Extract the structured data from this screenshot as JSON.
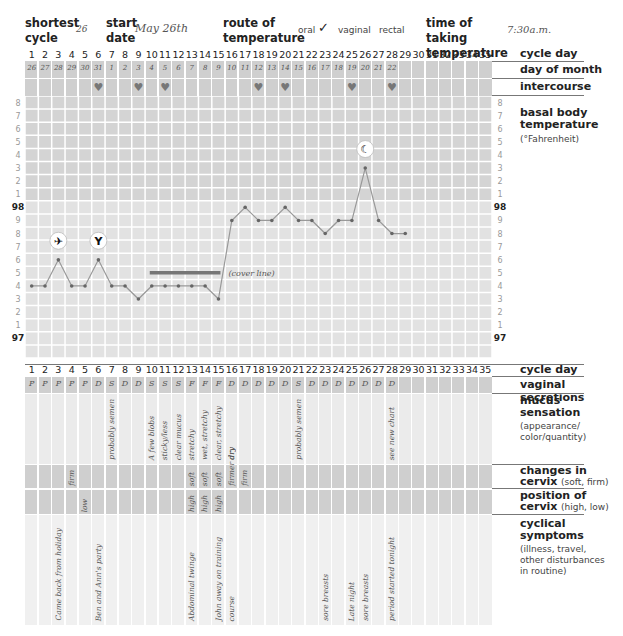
{
  "header": {
    "shortest_cycle_label": "shortest cycle",
    "shortest_cycle_value": "26",
    "start_date_label": "start date",
    "start_date_value": "May 26th",
    "route_label": "route of temperature",
    "route_options": [
      "oral",
      "vaginal",
      "rectal"
    ],
    "route_checked": "✓",
    "time_label": "time of taking temperature",
    "time_value": "7:30a.m."
  },
  "labels": {
    "cycle_day": "cycle day",
    "day_of_month": "day of month",
    "intercourse": "intercourse",
    "bbt_title": "basal body temperature",
    "bbt_unit": "(°Fahrenheit)",
    "vaginal_secretions": "vaginal secretions",
    "mucus_title": "mucus sensation",
    "mucus_sub": "(appearance/ color/quantity)",
    "changes_title": "changes in cervix",
    "changes_sub": "(soft, firm)",
    "position_title": "position of cervix",
    "position_sub": "(high, low)",
    "cyclical_title": "cyclical symptoms",
    "cyclical_sub": "(illness, travel, other disturbances in routine)",
    "cover_line": "(cover line)"
  },
  "cycle_days": [
    "1",
    "2",
    "3",
    "4",
    "5",
    "6",
    "7",
    "8",
    "9",
    "10",
    "11",
    "12",
    "13",
    "14",
    "15",
    "16",
    "17",
    "18",
    "19",
    "20",
    "21",
    "22",
    "23",
    "24",
    "25",
    "26",
    "27",
    "28",
    "29",
    "30",
    "31",
    "32",
    "33",
    "34",
    "35"
  ],
  "day_of_month": [
    "26",
    "27",
    "28",
    "29",
    "30",
    "31",
    "1",
    "2",
    "3",
    "4",
    "5",
    "6",
    "7",
    "8",
    "9",
    "10",
    "11",
    "12",
    "13",
    "14",
    "15",
    "16",
    "17",
    "18",
    "19",
    "20",
    "21",
    "22"
  ],
  "intercourse_days": [
    6,
    9,
    11,
    18,
    20,
    25,
    28
  ],
  "vaginal_secretions": [
    "P",
    "P",
    "P",
    "P",
    "P",
    "D",
    "S",
    "D",
    "D",
    "S",
    "S",
    "S",
    "F",
    "F",
    "F",
    "D",
    "D",
    "D",
    "D",
    "D",
    "S",
    "D",
    "D",
    "D",
    "D",
    "D",
    "D",
    "D"
  ],
  "mucus_notes": [
    {
      "day": 7,
      "text": "probably semen"
    },
    {
      "day": 10,
      "text": "A few blobs"
    },
    {
      "day": 11,
      "text": "sticky/less"
    },
    {
      "day": 12,
      "text": "clear mucus"
    },
    {
      "day": 13,
      "text": "stretchy"
    },
    {
      "day": 14,
      "text": "wet, stretchy"
    },
    {
      "day": 15,
      "text": "clear, stretchy"
    },
    {
      "day": 16,
      "text": "dry"
    },
    {
      "day": 21,
      "text": "probably semen"
    },
    {
      "day": 28,
      "text": "see new chart"
    }
  ],
  "cervix_changes": [
    {
      "day": 4,
      "text": "firm"
    },
    {
      "day": 13,
      "text": "soft"
    },
    {
      "day": 14,
      "text": "soft"
    },
    {
      "day": 15,
      "text": "soft"
    },
    {
      "day": 16,
      "text": "firmer dry"
    },
    {
      "day": 17,
      "text": "firm"
    }
  ],
  "cervix_position": [
    {
      "day": 5,
      "text": "low"
    },
    {
      "day": 13,
      "text": "high"
    },
    {
      "day": 14,
      "text": "high"
    },
    {
      "day": 15,
      "text": "high"
    }
  ],
  "cyclical_symptoms": [
    {
      "day": 3,
      "text": "Came back from holiday"
    },
    {
      "day": 6,
      "text": "Ben and Ann's party"
    },
    {
      "day": 13,
      "text": "Abdominal twinge"
    },
    {
      "day": 15,
      "text": "John away on training"
    },
    {
      "day": 16,
      "text": "course"
    },
    {
      "day": 23,
      "text": "sore breasts"
    },
    {
      "day": 25,
      "text": "Late night"
    },
    {
      "day": 26,
      "text": "sore breasts"
    },
    {
      "day": 28,
      "text": "period started tonight"
    }
  ],
  "y_tick_labels": [
    "8",
    "7",
    "6",
    "5",
    "4",
    "3",
    "2",
    "1",
    "98",
    "9",
    "8",
    "7",
    "6",
    "5",
    "4",
    "3",
    "2",
    "1",
    "97"
  ],
  "icons": [
    {
      "day": 3,
      "name": "airplane-icon",
      "glyph": "✈"
    },
    {
      "day": 6,
      "name": "wine-glass-icon",
      "glyph": "🍷"
    },
    {
      "day": 26,
      "name": "moon-icon",
      "glyph": "☾"
    }
  ],
  "chart_data": {
    "type": "line",
    "xlabel": "cycle day",
    "ylabel": "°F",
    "x": [
      1,
      2,
      3,
      4,
      5,
      6,
      7,
      8,
      9,
      10,
      11,
      12,
      13,
      14,
      15,
      16,
      17,
      18,
      19,
      20,
      21,
      22,
      23,
      24,
      25,
      26,
      27,
      28,
      29
    ],
    "series": [
      {
        "name": "basal body temperature",
        "values": [
          97.4,
          97.4,
          97.6,
          97.4,
          97.4,
          97.6,
          97.4,
          97.4,
          97.3,
          97.4,
          97.4,
          97.4,
          97.4,
          97.4,
          97.3,
          97.9,
          98.0,
          97.9,
          97.9,
          98.0,
          97.9,
          97.9,
          97.8,
          97.9,
          97.9,
          98.3,
          97.9,
          97.8,
          97.8
        ]
      }
    ],
    "cover_line": {
      "value": 97.5,
      "from_day": 10,
      "to_day": 15,
      "label": "(cover line)"
    },
    "xlim": [
      1,
      35
    ],
    "ylim": [
      96.9,
      98.8
    ],
    "grid": true,
    "annotations": [
      {
        "day": 3,
        "icon": "airplane"
      },
      {
        "day": 6,
        "icon": "wine glass"
      },
      {
        "day": 26,
        "icon": "moon"
      }
    ]
  },
  "colors": {
    "grid_bg": "#cfcfcf",
    "grid_line": "#ffffff",
    "line": "#8a8a8a",
    "point": "#666666",
    "cover_line": "#777777",
    "heart": "#777777"
  }
}
